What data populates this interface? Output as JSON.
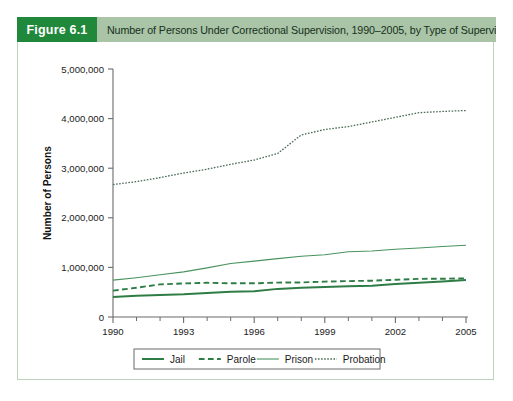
{
  "figure": {
    "number_label": "Figure 6.1",
    "title": "Number of Persons Under Correctional Supervision, 1990–2005, by Type of Supervision",
    "number_box_color": "#20883a",
    "title_band_color": "#a9c4a6",
    "frame_border_color": "#bcd4bb"
  },
  "chart_data": {
    "type": "line",
    "title": "Number of Persons Under Correctional Supervision, 1990–2005, by Type of Supervision",
    "xlabel": "",
    "ylabel": "Number of Persons",
    "xlim": [
      1990,
      2005
    ],
    "ylim": [
      0,
      5000000
    ],
    "yticks": [
      0,
      1000000,
      2000000,
      3000000,
      4000000,
      5000000
    ],
    "ytick_labels": [
      "0",
      "1,000,000",
      "2,000,000",
      "3,000,000",
      "4,000,000",
      "5,000,000"
    ],
    "xticks": [
      1990,
      1993,
      1996,
      1999,
      2002,
      2005
    ],
    "xtick_labels": [
      "1990",
      "1993",
      "1996",
      "1999",
      "2002",
      "2005"
    ],
    "x_minor_ticks": [
      1991,
      1992,
      1994,
      1995,
      1997,
      1998,
      2000,
      2001,
      2003,
      2004
    ],
    "grid": false,
    "legend_position": "bottom-center",
    "x": [
      1990,
      1991,
      1992,
      1993,
      1994,
      1995,
      1996,
      1997,
      1998,
      1999,
      2000,
      2001,
      2002,
      2003,
      2004,
      2005
    ],
    "series": [
      {
        "name": "Jail",
        "style": "solid",
        "width": 2.0,
        "color": "#2e7d46",
        "values": [
          405000,
          426000,
          444000,
          459000,
          486000,
          507000,
          518000,
          567000,
          592000,
          606000,
          621000,
          631000,
          665000,
          691000,
          714000,
          747000
        ]
      },
      {
        "name": "Parole",
        "style": "dashed",
        "width": 1.9,
        "color": "#2e7d46",
        "values": [
          531000,
          590000,
          658000,
          676000,
          690000,
          679000,
          679000,
          694000,
          696000,
          714000,
          724000,
          732000,
          750000,
          769000,
          771000,
          780000
        ]
      },
      {
        "name": "Prison",
        "style": "solid",
        "width": 1.1,
        "color": "#49935f",
        "values": [
          743000,
          792000,
          851000,
          910000,
          990000,
          1078000,
          1127000,
          1176000,
          1224000,
          1254000,
          1316000,
          1330000,
          1367000,
          1390000,
          1421000,
          1446000
        ]
      },
      {
        "name": "Probation",
        "style": "dotted",
        "width": 1.3,
        "color": "#4b6b56",
        "values": [
          2670000,
          2729000,
          2811000,
          2903000,
          2981000,
          3078000,
          3165000,
          3297000,
          3671000,
          3780000,
          3839000,
          3932000,
          4025000,
          4120000,
          4144000,
          4163000
        ]
      }
    ],
    "legend": [
      {
        "label": "Jail",
        "style": "solid",
        "width": 2.0,
        "color": "#2e7d46"
      },
      {
        "label": "Parole",
        "style": "dashed",
        "width": 1.9,
        "color": "#2e7d46"
      },
      {
        "label": "Prison",
        "style": "solid",
        "width": 1.1,
        "color": "#49935f"
      },
      {
        "label": "Probation",
        "style": "dotted",
        "width": 1.3,
        "color": "#4b6b56"
      }
    ]
  }
}
